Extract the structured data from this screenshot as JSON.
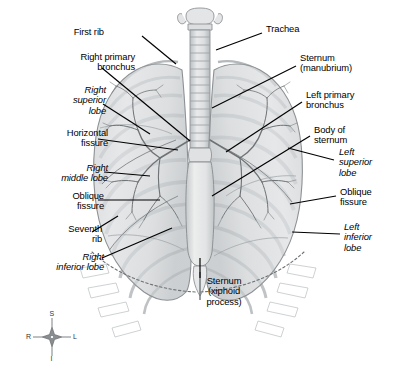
{
  "figure": {
    "background_color": "#ffffff",
    "line_color": "#000000",
    "tissue_color": "#d8dadc"
  },
  "labels": [
    {
      "id": "first-rib",
      "text": "First rib",
      "style": "plain",
      "align": "right",
      "x": 104,
      "y": 32
    },
    {
      "id": "right-primary-bronchus",
      "text": "Right primary\nbronchus",
      "style": "plain",
      "align": "right",
      "x": 35,
      "y": 56
    },
    {
      "id": "right-superior-lobe",
      "text": "Right\nsuperior\nlobe",
      "style": "italic",
      "align": "right",
      "x": 63,
      "y": 88
    },
    {
      "id": "horizontal-fissure",
      "text": "Horizontal\nfissure",
      "style": "plain",
      "align": "right",
      "x": 38,
      "y": 131
    },
    {
      "id": "right-middle-lobe",
      "text": "Right\nmiddle lobe",
      "style": "italic",
      "align": "right",
      "x": 41,
      "y": 166
    },
    {
      "id": "oblique-fissure-right",
      "text": "Oblique\nfissure",
      "style": "plain",
      "align": "right",
      "x": 39,
      "y": 194
    },
    {
      "id": "seventh-rib",
      "text": "Seventh\nrib",
      "style": "plain",
      "align": "right",
      "x": 40,
      "y": 227
    },
    {
      "id": "right-inferior-lobe",
      "text": "Right\ninferior lobe",
      "style": "italic",
      "align": "right",
      "x": 20,
      "y": 255
    },
    {
      "id": "trachea",
      "text": "Trachea",
      "style": "plain",
      "align": "left",
      "x": 266,
      "y": 27
    },
    {
      "id": "sternum-manubrium",
      "text": "Sternum\n(manubrium)",
      "style": "plain",
      "align": "left",
      "x": 300,
      "y": 56
    },
    {
      "id": "left-primary-bronchus",
      "text": "Left primary\nbronchus",
      "style": "plain",
      "align": "left",
      "x": 306,
      "y": 93
    },
    {
      "id": "body-of-sternum",
      "text": "Body of\nsternum",
      "style": "plain",
      "align": "left",
      "x": 314,
      "y": 128
    },
    {
      "id": "left-superior-lobe",
      "text": "Left\nsuperior\nlobe",
      "style": "italic",
      "align": "left",
      "x": 339,
      "y": 150
    },
    {
      "id": "oblique-fissure-left",
      "text": "Oblique\nfissure",
      "style": "plain",
      "align": "left",
      "x": 340,
      "y": 190
    },
    {
      "id": "left-inferior-lobe",
      "text": "Left\ninferior\nlobe",
      "style": "italic",
      "align": "left",
      "x": 344,
      "y": 225
    },
    {
      "id": "sternum-xiphoid",
      "text": "Sternum\n(xiphoid\nprocess)",
      "style": "plain",
      "align": "center",
      "x": 224,
      "y": 266
    }
  ],
  "compass": {
    "superior": "S",
    "inferior": "I",
    "right": "R",
    "left": "L",
    "center_x": 52,
    "center_y": 337
  }
}
